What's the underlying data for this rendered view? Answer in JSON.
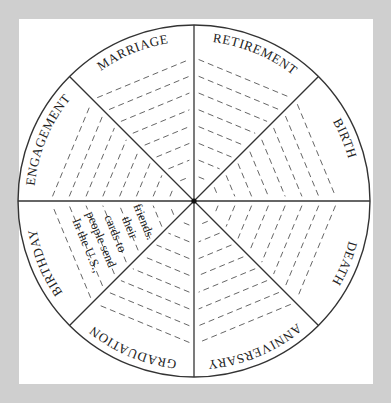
{
  "wheel": {
    "center": [
      194,
      201
    ],
    "radius": 176,
    "label_radius": 160,
    "line_color": "#333333",
    "background_color": "#cfcfcf",
    "sheet_color": "#ffffff",
    "segments": [
      {
        "id": "retirement",
        "label": "RETIREMENT",
        "start_deg": -90,
        "end_deg": -45
      },
      {
        "id": "birth",
        "label": "BIRTH",
        "start_deg": -45,
        "end_deg": 0
      },
      {
        "id": "death",
        "label": "DEATH",
        "start_deg": 0,
        "end_deg": 45
      },
      {
        "id": "anniversary",
        "label": "ANNIVERSARY",
        "start_deg": 45,
        "end_deg": 90
      },
      {
        "id": "graduation",
        "label": "GRADUATION",
        "start_deg": 90,
        "end_deg": 135
      },
      {
        "id": "birthday",
        "label": "BIRTHDAY",
        "start_deg": 135,
        "end_deg": 180
      },
      {
        "id": "engagement",
        "label": "ENGAGEMENT",
        "start_deg": 180,
        "end_deg": 225
      },
      {
        "id": "marriage",
        "label": "MARRIAGE",
        "start_deg": 225,
        "end_deg": 270
      }
    ],
    "dashed_lines_per_segment": 9,
    "birthday_note": {
      "lines": [
        "In the U.S.,",
        "people send",
        "cards to",
        "their",
        "friends."
      ]
    }
  }
}
